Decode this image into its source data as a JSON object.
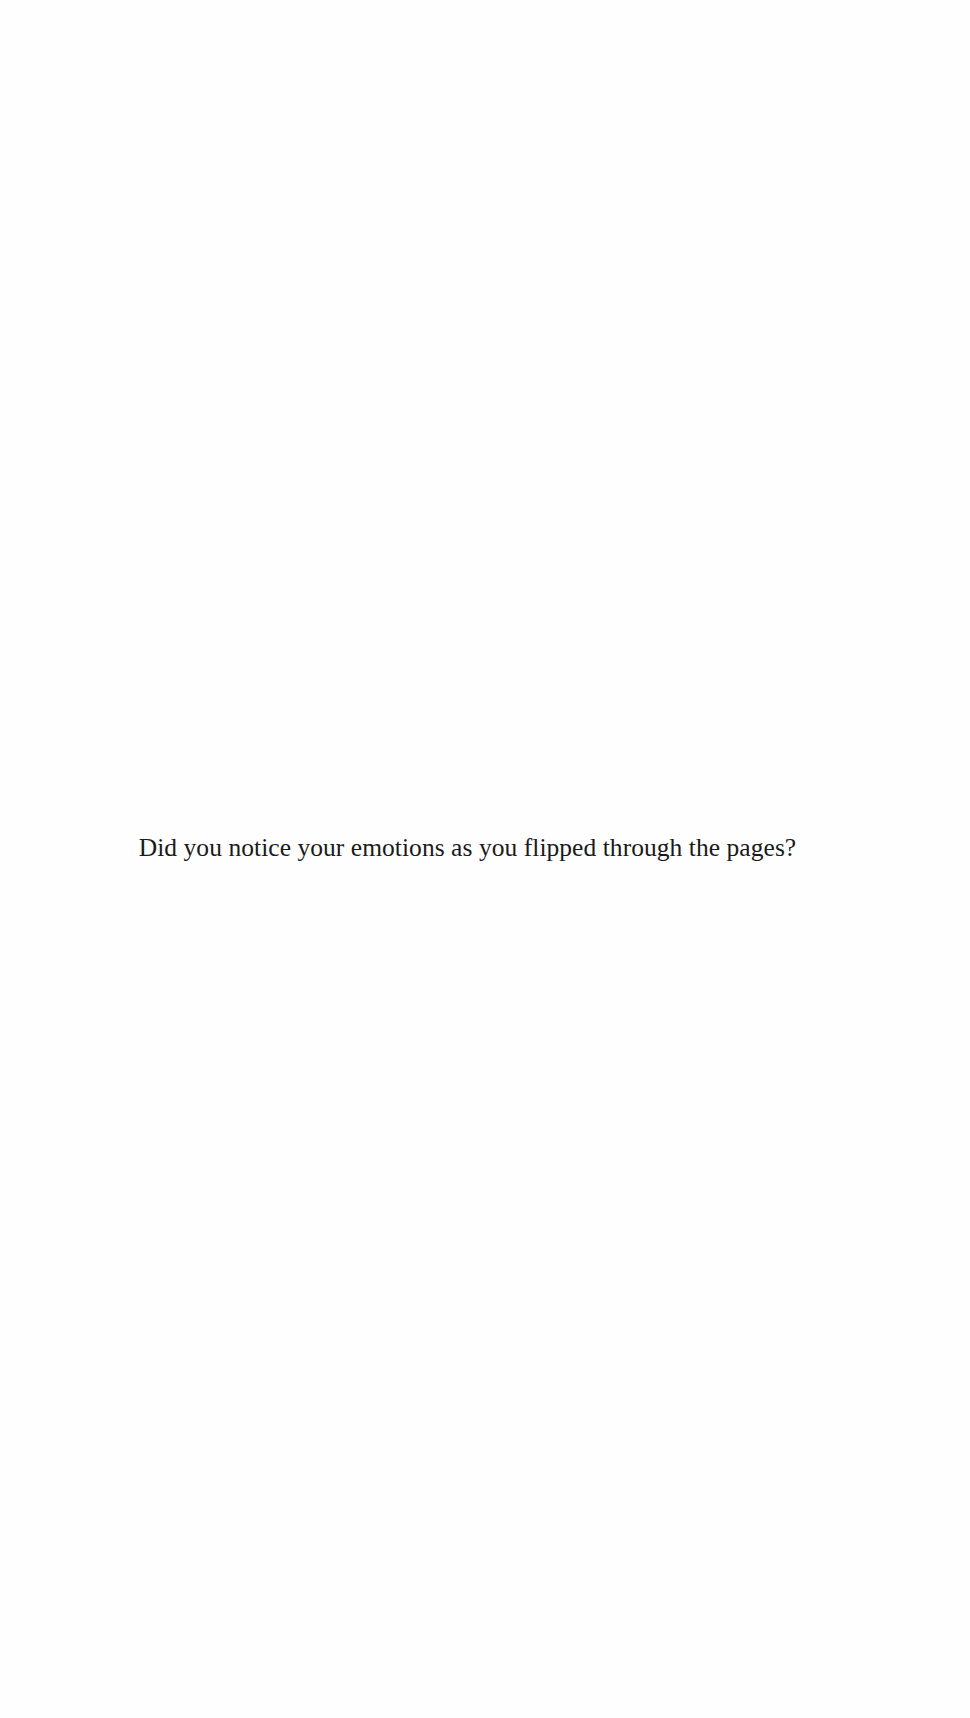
{
  "page": {
    "text": "Did you notice your emotions as you flipped through the pages?"
  }
}
